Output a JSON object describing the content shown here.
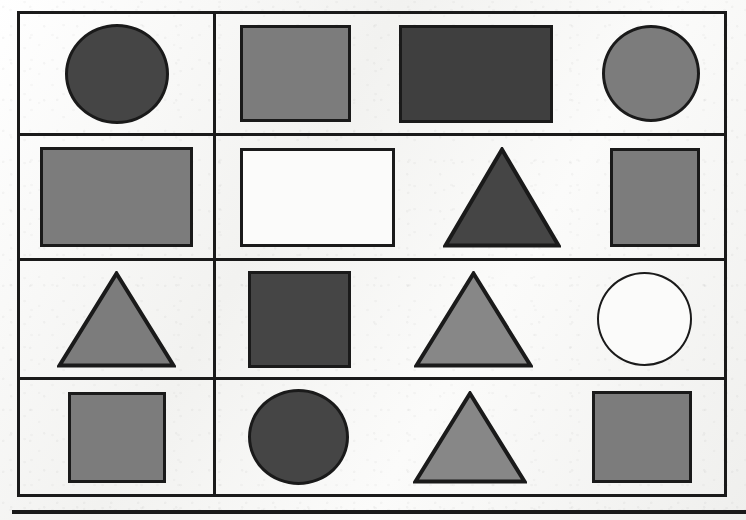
{
  "page": {
    "kind": "worksheet-scan",
    "paper_color": "#f4f4f2",
    "ink_color": "#1a1a1a"
  },
  "palette": {
    "dark": "#454545",
    "darker": "#3f3f3f",
    "medium": "#7c7c7c",
    "light_medium": "#878787",
    "white": "#fbfbfa",
    "outline": "#1a1a1a"
  },
  "table": {
    "rows": 4,
    "columns": 2,
    "left_column_width": 196,
    "right_column_width": 508,
    "border_width": 3
  },
  "bottom_rule": {
    "label": "horizontal-rule",
    "thickness": 4
  },
  "shapes": {
    "rows": [
      {
        "row_index": 1,
        "height": 122,
        "left_cell": [
          {
            "type": "circle",
            "fill": "dark",
            "w": 104,
            "h": 100,
            "label": "dark-gray-circle"
          }
        ],
        "right_cell": [
          {
            "type": "rect",
            "fill": "medium",
            "w": 111,
            "h": 97,
            "label": "gray-square"
          },
          {
            "type": "rect",
            "fill": "darker",
            "w": 154,
            "h": 98,
            "label": "dark-gray-rectangle"
          },
          {
            "type": "circle",
            "fill": "medium",
            "w": 98,
            "h": 97,
            "label": "gray-circle"
          }
        ]
      },
      {
        "row_index": 2,
        "height": 125,
        "left_cell": [
          {
            "type": "rect",
            "fill": "medium",
            "w": 153,
            "h": 100,
            "label": "gray-rectangle"
          }
        ],
        "right_cell": [
          {
            "type": "rect",
            "fill": "white",
            "w": 155,
            "h": 99,
            "label": "white-rectangle"
          },
          {
            "type": "triangle",
            "fill": "dark",
            "w": 118,
            "h": 101,
            "label": "dark-gray-triangle"
          },
          {
            "type": "rect",
            "fill": "medium",
            "w": 90,
            "h": 99,
            "label": "gray-square"
          }
        ]
      },
      {
        "row_index": 3,
        "height": 119,
        "left_cell": [
          {
            "type": "triangle",
            "fill": "medium",
            "w": 119,
            "h": 97,
            "label": "gray-triangle"
          }
        ],
        "right_cell": [
          {
            "type": "rect",
            "fill": "dark",
            "w": 103,
            "h": 97,
            "label": "dark-gray-square"
          },
          {
            "type": "triangle",
            "fill": "light_medium",
            "w": 119,
            "h": 97,
            "label": "gray-triangle"
          },
          {
            "type": "circle",
            "fill": "white",
            "w": 95,
            "h": 94,
            "label": "white-circle"
          }
        ]
      },
      {
        "row_index": 4,
        "height": 114,
        "left_cell": [
          {
            "type": "rect",
            "fill": "medium",
            "w": 98,
            "h": 91,
            "label": "gray-square"
          }
        ],
        "right_cell": [
          {
            "type": "circle",
            "fill": "dark",
            "w": 101,
            "h": 96,
            "label": "dark-gray-circle"
          },
          {
            "type": "triangle",
            "fill": "light_medium",
            "w": 114,
            "h": 93,
            "label": "gray-triangle"
          },
          {
            "type": "rect",
            "fill": "medium",
            "w": 100,
            "h": 92,
            "label": "gray-square"
          }
        ]
      }
    ]
  }
}
